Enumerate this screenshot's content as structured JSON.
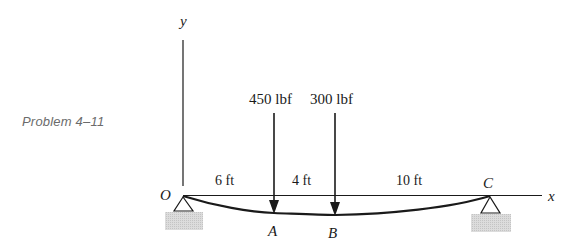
{
  "caption": "Problem 4–11",
  "axes": {
    "x_label": "x",
    "y_label": "y"
  },
  "points": {
    "origin": "O",
    "A": "A",
    "B": "B",
    "C": "C"
  },
  "loads": [
    {
      "label": "450 lbf",
      "at": "A"
    },
    {
      "label": "300 lbf",
      "at": "B"
    }
  ],
  "dimensions": [
    {
      "label": "6 ft",
      "from": "O",
      "to": "A"
    },
    {
      "label": "4 ft",
      "from": "A",
      "to": "B"
    },
    {
      "label": "10 ft",
      "from": "B",
      "to": "C"
    }
  ],
  "colors": {
    "line": "#1a1a1a",
    "ground": "#d4d4d4",
    "caption": "#6b6b6b"
  }
}
